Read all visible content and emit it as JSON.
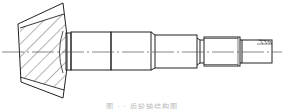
{
  "figure": {
    "type": "technical-drawing",
    "caption": "图 · · 齿轮轴结构图",
    "colors": {
      "line": "#222222",
      "hatch": "#444444",
      "centerline": "#555555",
      "caption": "#b8b8b8",
      "background": "#ffffff"
    }
  },
  "geometry": {
    "centerline_y": 52,
    "centerline_x": [
      2,
      282
    ],
    "gear": {
      "outline": [
        [
          18,
          24
        ],
        [
          63,
          3
        ],
        [
          67,
          36
        ],
        [
          67,
          68
        ],
        [
          63,
          98
        ],
        [
          21,
          82
        ]
      ],
      "inner_top": [
        [
          20,
          28
        ],
        [
          64,
          14
        ]
      ],
      "inner_bottom": [
        [
          20,
          77
        ],
        [
          64,
          90
        ]
      ],
      "hatch_region": [
        [
          20,
          28
        ],
        [
          64,
          14
        ],
        [
          66,
          36
        ],
        [
          66,
          68
        ],
        [
          64,
          90
        ],
        [
          20,
          77
        ]
      ]
    },
    "sections": [
      {
        "name": "hub-collar",
        "x1": 66,
        "x2": 71,
        "top": 33,
        "bottom": 70
      },
      {
        "name": "journal-1",
        "x1": 71,
        "x2": 111,
        "top": 32,
        "bottom": 70
      },
      {
        "name": "journal-2",
        "x1": 111,
        "x2": 151,
        "top": 32,
        "bottom": 70
      },
      {
        "name": "shoulder",
        "x1": 155,
        "x2": 197,
        "top": 35,
        "bottom": 68
      },
      {
        "name": "thread",
        "x1": 204,
        "x2": 240,
        "top": 37,
        "bottom": 66
      },
      {
        "name": "end",
        "x1": 242,
        "x2": 272,
        "top": 40,
        "bottom": 63
      }
    ]
  }
}
